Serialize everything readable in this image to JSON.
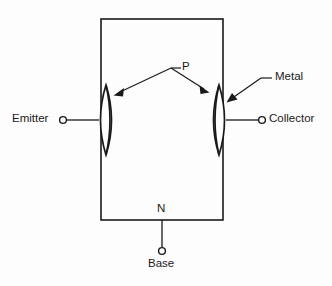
{
  "diagram": {
    "type": "schematic",
    "background_color": "#fdfdfd",
    "line_color": "#1a1a1a",
    "labels": {
      "emitter": "Emitter",
      "collector": "Collector",
      "base": "Base",
      "p_region": "P",
      "n_region": "N",
      "metal": "Metal"
    },
    "annotations": [
      {
        "name": "p-callout",
        "text": "P",
        "targets": [
          "left-junction-lens",
          "right-junction-lens"
        ],
        "arrow_count": 2
      },
      {
        "name": "metal-callout",
        "text": "Metal",
        "targets": [
          "right-junction-lens"
        ],
        "arrow_count": 1
      }
    ],
    "terminals": [
      {
        "name": "emitter-terminal",
        "label": "Emitter",
        "side": "left"
      },
      {
        "name": "collector-terminal",
        "label": "Collector",
        "side": "right"
      },
      {
        "name": "base-terminal",
        "label": "Base",
        "side": "bottom"
      }
    ],
    "regions": [
      {
        "name": "base-body",
        "label": "N",
        "shape": "rectangle"
      },
      {
        "name": "left-junction-lens",
        "label": "P",
        "shape": "lens"
      },
      {
        "name": "right-junction-lens",
        "label": "P",
        "shape": "lens"
      }
    ]
  }
}
